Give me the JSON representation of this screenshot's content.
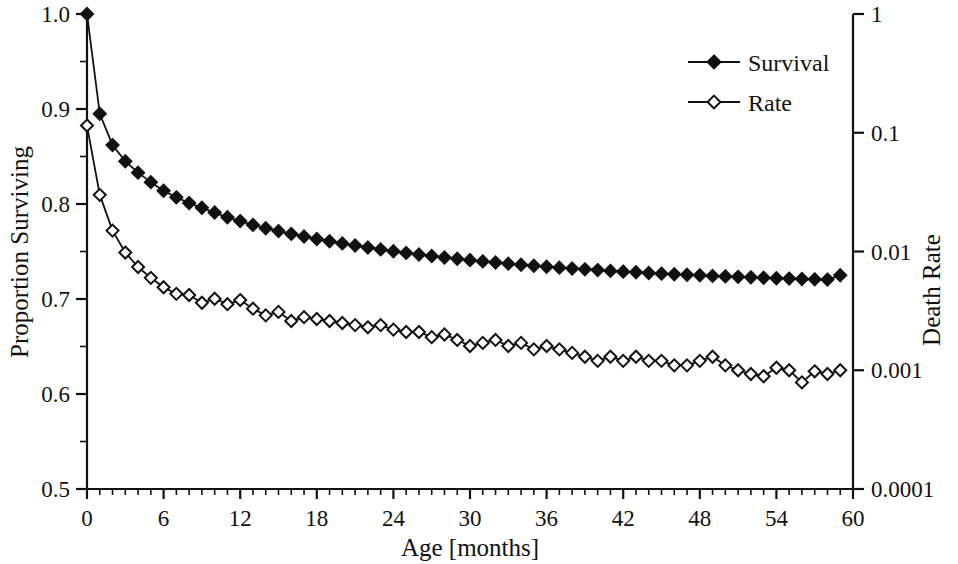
{
  "chart_data": {
    "type": "line",
    "title": "",
    "xlabel": "Age [months]",
    "ylabel": "Proportion Surviving",
    "y2label": "Death Rate",
    "xlim": [
      0,
      60
    ],
    "ylim": [
      0.5,
      1.0
    ],
    "y2lim": [
      0.0001,
      1
    ],
    "y2scale": "log",
    "grid": false,
    "legend_position": "top-right",
    "xticks": [
      0,
      6,
      12,
      18,
      24,
      30,
      36,
      42,
      48,
      54,
      60
    ],
    "xticklabels": [
      "0",
      "6",
      "12",
      "18",
      "24",
      "30",
      "36",
      "42",
      "48",
      "54",
      "60"
    ],
    "xminor_step": 1,
    "yticks": [
      0.5,
      0.6,
      0.7,
      0.8,
      0.9,
      1.0
    ],
    "yticklabels": [
      "0.5",
      "0.6",
      "0.7",
      "0.8",
      "0.9",
      "1.0"
    ],
    "yminor": [
      0.55,
      0.65,
      0.75,
      0.85,
      0.95
    ],
    "y2ticks": [
      1,
      0.1,
      0.01,
      0.001,
      0.0001
    ],
    "y2ticklabels": [
      "1",
      "0.1",
      "0.01",
      "0.001",
      "0.0001"
    ],
    "x": [
      0,
      1,
      2,
      3,
      4,
      5,
      6,
      7,
      8,
      9,
      10,
      11,
      12,
      13,
      14,
      15,
      16,
      17,
      18,
      19,
      20,
      21,
      22,
      23,
      24,
      25,
      26,
      27,
      28,
      29,
      30,
      31,
      32,
      33,
      34,
      35,
      36,
      37,
      38,
      39,
      40,
      41,
      42,
      43,
      44,
      45,
      46,
      47,
      48,
      49,
      50,
      51,
      52,
      53,
      54,
      55,
      56,
      57,
      58,
      59
    ],
    "series": [
      {
        "name": "Survival",
        "marker": "filled-diamond",
        "axis": "left",
        "values": [
          1.0,
          0.895,
          0.862,
          0.845,
          0.833,
          0.823,
          0.814,
          0.807,
          0.801,
          0.796,
          0.791,
          0.786,
          0.782,
          0.778,
          0.7745,
          0.7715,
          0.7685,
          0.7658,
          0.7632,
          0.7608,
          0.7585,
          0.7563,
          0.7542,
          0.7522,
          0.7503,
          0.7485,
          0.7468,
          0.7452,
          0.7437,
          0.7423,
          0.7409,
          0.7396,
          0.7384,
          0.7372,
          0.7361,
          0.735,
          0.734,
          0.733,
          0.7321,
          0.7312,
          0.7304,
          0.7296,
          0.7288,
          0.7281,
          0.7274,
          0.7267,
          0.7261,
          0.7255,
          0.7249,
          0.7243,
          0.7238,
          0.7233,
          0.7228,
          0.7223,
          0.7219,
          0.7215,
          0.7211,
          0.7207,
          0.7204,
          0.725
        ]
      },
      {
        "name": "Rate",
        "marker": "open-diamond",
        "axis": "right",
        "values": [
          0.115,
          0.03,
          0.015,
          0.0098,
          0.0074,
          0.006,
          0.005,
          0.0044,
          0.0043,
          0.0037,
          0.004,
          0.0036,
          0.0039,
          0.0033,
          0.0029,
          0.0031,
          0.0026,
          0.0028,
          0.0027,
          0.0026,
          0.0025,
          0.0024,
          0.0023,
          0.0024,
          0.0022,
          0.0021,
          0.0021,
          0.0019,
          0.002,
          0.0018,
          0.0016,
          0.0017,
          0.0018,
          0.0016,
          0.0017,
          0.0015,
          0.0016,
          0.0015,
          0.0014,
          0.0013,
          0.0012,
          0.0013,
          0.0012,
          0.0013,
          0.0012,
          0.0012,
          0.0011,
          0.0011,
          0.0012,
          0.0013,
          0.0011,
          0.001,
          0.00093,
          0.00089,
          0.00105,
          0.001,
          0.00079,
          0.00098,
          0.00093,
          0.001
        ]
      }
    ]
  },
  "legend": {
    "items": [
      {
        "label": "Survival",
        "marker": "filled-diamond"
      },
      {
        "label": "Rate",
        "marker": "open-diamond"
      }
    ]
  }
}
